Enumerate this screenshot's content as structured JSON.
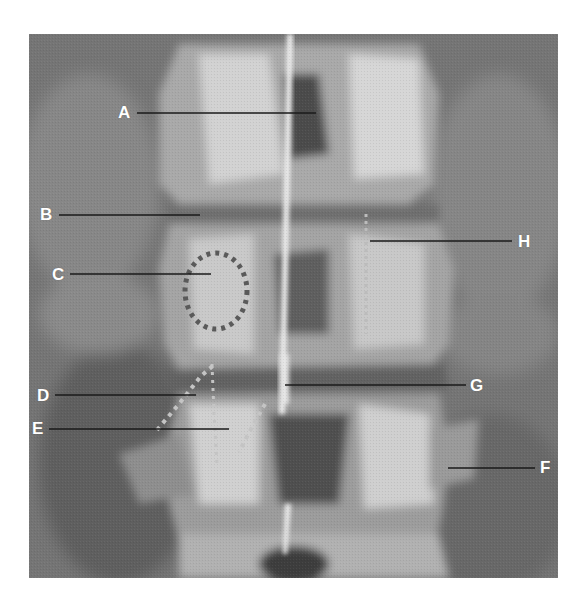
{
  "figure": {
    "type": "radiograph",
    "view": "lumbar spine, AP",
    "colors": {
      "background": "#7a7a7a",
      "bone": "#d8d8d8",
      "leader_line": "#1a1a1a",
      "label_text": "#ffffff",
      "dotted_outline_c": "#5a5a5a",
      "dotted_outline_de": "#bdbdbd"
    }
  },
  "labels": [
    {
      "id": "A",
      "text": "A",
      "x": 118,
      "y": 104,
      "line": {
        "x1": 137,
        "y1": 113,
        "x2": 316,
        "y2": 113
      }
    },
    {
      "id": "B",
      "text": "B",
      "x": 40,
      "y": 206,
      "line": {
        "x1": 59,
        "y1": 215,
        "x2": 200,
        "y2": 215
      }
    },
    {
      "id": "C",
      "text": "C",
      "x": 52,
      "y": 266,
      "line": {
        "x1": 70,
        "y1": 274,
        "x2": 211,
        "y2": 274
      }
    },
    {
      "id": "D",
      "text": "D",
      "x": 37,
      "y": 387,
      "line": {
        "x1": 55,
        "y1": 395,
        "x2": 196,
        "y2": 395
      }
    },
    {
      "id": "E",
      "text": "E",
      "x": 32,
      "y": 420,
      "line": {
        "x1": 49,
        "y1": 429,
        "x2": 229,
        "y2": 429
      }
    },
    {
      "id": "F",
      "text": "F",
      "x": 540,
      "y": 459,
      "line": {
        "x1": 448,
        "y1": 468,
        "x2": 535,
        "y2": 468
      }
    },
    {
      "id": "G",
      "text": "G",
      "x": 470,
      "y": 377,
      "line": {
        "x1": 285,
        "y1": 385,
        "x2": 466,
        "y2": 385
      }
    },
    {
      "id": "H",
      "text": "H",
      "x": 518,
      "y": 233,
      "line": {
        "x1": 370,
        "y1": 241,
        "x2": 512,
        "y2": 241
      }
    }
  ]
}
